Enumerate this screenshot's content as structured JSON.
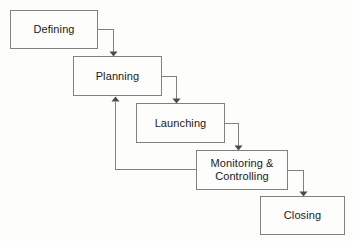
{
  "diagram": {
    "type": "flowchart-cascade",
    "background_color": "#fdfdfc",
    "box_stroke_color": "#808080",
    "connector_color": "#808080",
    "arrowhead_color": "#4a4a4a",
    "text_color": "#1a1a1a",
    "nodes": [
      {
        "id": "defining",
        "label": "Defining",
        "x": 10,
        "y": 10,
        "width": 88,
        "height": 39,
        "lines": 1
      },
      {
        "id": "planning",
        "label": "Planning",
        "x": 73,
        "y": 56,
        "width": 89,
        "height": 40,
        "lines": 1
      },
      {
        "id": "launching",
        "label": "Launching",
        "x": 136,
        "y": 103,
        "width": 89,
        "height": 40,
        "lines": 1
      },
      {
        "id": "monitoring-controlling",
        "label": "Monitoring &\nControlling",
        "x": 196,
        "y": 150,
        "width": 92,
        "height": 40,
        "lines": 2
      },
      {
        "id": "closing",
        "label": "Closing",
        "x": 260,
        "y": 196,
        "width": 85,
        "height": 39,
        "lines": 1
      }
    ],
    "connectors": [
      {
        "id": "defining-to-planning",
        "from": "defining",
        "to": "planning",
        "kind": "forward",
        "path": "M 98 29.5 L 113.5 29.5 L 113.5 51.5",
        "arrow_points": "109.5,51.5 117.5,51.5 113.5,56.5",
        "direction": "down"
      },
      {
        "id": "planning-to-launching",
        "from": "planning",
        "to": "launching",
        "kind": "forward",
        "path": "M 162 76 L 176.5 76 L 176.5 98.5",
        "arrow_points": "172.5,98.5 180.5,98.5 176.5,103.5",
        "direction": "down"
      },
      {
        "id": "launching-to-monitoring",
        "from": "launching",
        "to": "monitoring-controlling",
        "kind": "forward",
        "path": "M 225 123 L 238.5 123 L 238.5 145.5",
        "arrow_points": "234.5,145.5 242.5,145.5 238.5,150.5",
        "direction": "down"
      },
      {
        "id": "monitoring-to-closing",
        "from": "monitoring-controlling",
        "to": "closing",
        "kind": "forward",
        "path": "M 288 170 L 303.5 170 L 303.5 191.5",
        "arrow_points": "299.5,191.5 307.5,191.5 303.5,196.5",
        "direction": "down"
      },
      {
        "id": "monitoring-to-planning-feedback",
        "from": "monitoring-controlling",
        "to": "planning",
        "kind": "feedback",
        "path": "M 196 169.5 L 115.5 169.5 L 115.5 101.5",
        "arrow_points": "111.5,101.5 119.5,101.5 115.5,96.5",
        "direction": "up"
      }
    ]
  }
}
